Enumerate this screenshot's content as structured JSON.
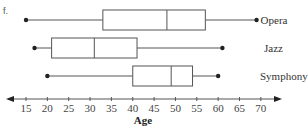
{
  "problem_label": "f.",
  "chart_data": {
    "type": "boxplot",
    "title": "",
    "xlabel": "Age",
    "ylabel": "",
    "xlim": [
      15,
      70
    ],
    "xticks": [
      15,
      20,
      25,
      30,
      35,
      40,
      45,
      50,
      55,
      60,
      65,
      70
    ],
    "grid": false,
    "orientation": "horizontal",
    "series": [
      {
        "name": "Opera",
        "min": 15,
        "q1": 33,
        "median": 48,
        "q3": 57,
        "max": 69
      },
      {
        "name": "Jazz",
        "min": 17,
        "q1": 21,
        "median": 31,
        "q3": 41,
        "max": 61
      },
      {
        "name": "Symphony",
        "min": 20,
        "q1": 40,
        "median": 49,
        "q3": 54,
        "max": 60
      }
    ]
  },
  "colors": {
    "line": "#555555",
    "box_fill": "#ffffff",
    "dot": "#222222",
    "text": "#333333"
  }
}
